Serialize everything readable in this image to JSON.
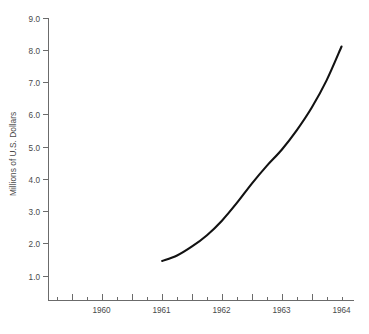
{
  "chart_data": {
    "type": "line",
    "title": "",
    "subtitle": "",
    "xlabel": "",
    "ylabel": "Millions of U.S. Dollars",
    "xlim": [
      1959.6,
      1964.7
    ],
    "ylim": [
      0.0,
      9.0
    ],
    "grid": false,
    "legend": null,
    "x_tick_labels": [
      "1960",
      "1961",
      "1962",
      "1963",
      "1964"
    ],
    "x_tick_values": [
      1960,
      1961,
      1962,
      1963,
      1964
    ],
    "x_minor_ticks_per_interval": 3,
    "y_tick_labels": [
      "1.0",
      "2.0",
      "3.0",
      "4.0",
      "5.0",
      "6.0",
      "7.0",
      "8.0",
      "9.0"
    ],
    "y_tick_values": [
      1.0,
      2.0,
      3.0,
      4.0,
      5.0,
      6.0,
      7.0,
      8.0,
      9.0
    ],
    "series": [
      {
        "name": "",
        "color": "#121212",
        "x": [
          1961.5,
          1961.75,
          1962.0,
          1962.25,
          1962.5,
          1962.75,
          1963.0,
          1963.25,
          1963.5,
          1963.75,
          1964.0,
          1964.25,
          1964.5
        ],
        "values": [
          1.45,
          1.62,
          1.9,
          2.25,
          2.7,
          3.25,
          3.85,
          4.4,
          4.9,
          5.5,
          6.2,
          7.05,
          8.1
        ]
      }
    ]
  },
  "colors": {
    "curve": "#121212",
    "axis": "#6b6b6b",
    "text": "#4a4a4a",
    "background": "#ffffff"
  }
}
